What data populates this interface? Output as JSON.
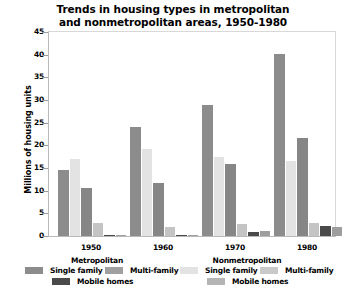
{
  "chart_data": {
    "type": "bar",
    "title": "Trends in housing types in metropolitan and nonmetropolitan areas, 1950-1980",
    "title_lines": [
      "Trends in housing types in metropolitan",
      "and nonmetropolitan areas, 1950-1980"
    ],
    "xlabel": "",
    "ylabel": "Millions of housing units",
    "categories": [
      "1950",
      "1960",
      "1970",
      "1980"
    ],
    "ylim": [
      0,
      45
    ],
    "yticks": [
      0,
      5,
      10,
      15,
      20,
      25,
      30,
      35,
      40,
      45
    ],
    "ytick_labels": [
      "0",
      "5",
      "10",
      "15",
      "20",
      "25",
      "30",
      "35",
      "40",
      "45"
    ],
    "grid": false,
    "legend_position": "below",
    "series": [
      {
        "name": "Metropolitan Single family",
        "area": "Metropolitan",
        "housing_type": "Single family",
        "color": "#8c8c8c",
        "values": [
          14.5,
          24.0,
          29.0,
          40.1
        ]
      },
      {
        "name": "Nonmetropolitan Single family",
        "area": "Nonmetropolitan",
        "housing_type": "Single family",
        "color": "#e3e3e3",
        "values": [
          17.0,
          19.3,
          17.5,
          16.5
        ]
      },
      {
        "name": "Metropolitan Multi-family",
        "area": "Metropolitan",
        "housing_type": "Multi-family",
        "color": "#868686",
        "values": [
          10.7,
          11.6,
          15.9,
          21.7
        ]
      },
      {
        "name": "Nonmetropolitan Multi-family",
        "area": "Nonmetropolitan",
        "housing_type": "Multi-family",
        "color": "#c4c4c4",
        "values": [
          2.9,
          2.0,
          2.6,
          2.9
        ]
      },
      {
        "name": "Metropolitan Mobile homes",
        "area": "Metropolitan",
        "housing_type": "Mobile homes",
        "color": "#4a4a4a",
        "values": [
          0.1,
          0.3,
          0.8,
          2.1
        ]
      },
      {
        "name": "Nonmetropolitan Mobile homes",
        "area": "Nonmetropolitan",
        "housing_type": "Mobile homes",
        "color": "#9e9e9e",
        "values": [
          0.2,
          0.3,
          1.0,
          2.0
        ]
      }
    ]
  },
  "legend": {
    "groups": [
      {
        "title": "Metropolitan",
        "entries": [
          {
            "label": "Single family",
            "color": "#8c8c8c"
          },
          {
            "label": "Multi-family",
            "color": "#a0a0a0"
          },
          {
            "label": "Mobile homes",
            "color": "#4a4a4a"
          }
        ]
      },
      {
        "title": "Nonmetropolitan",
        "entries": [
          {
            "label": "Single family",
            "color": "#e3e3e3"
          },
          {
            "label": "Multi-family",
            "color": "#c9c9c9"
          },
          {
            "label": "Mobile homes",
            "color": "#b5b5b5"
          }
        ]
      }
    ]
  },
  "colors": {
    "background": "#ffffff",
    "text": "#000000",
    "axis": "#b9b9b9",
    "frame": "#d8d8d8"
  }
}
